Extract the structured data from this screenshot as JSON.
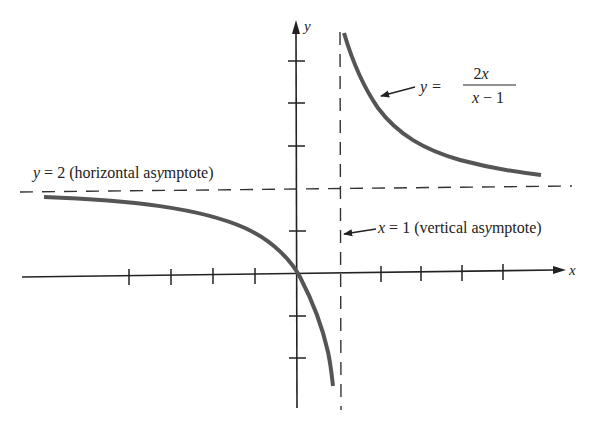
{
  "chart_data": {
    "type": "line",
    "title": "",
    "function_label": {
      "lhs": "y =",
      "numerator": "2x",
      "denominator": "x − 1"
    },
    "xlabel": "x",
    "ylabel": "y",
    "x_ticks": [
      -4,
      -3,
      -2,
      -1,
      1,
      2,
      3,
      4,
      5
    ],
    "y_ticks": [
      -2,
      -1,
      1,
      2,
      3,
      4,
      5
    ],
    "xlim": [
      -6.6,
      6.6
    ],
    "ylim": [
      -3.2,
      6.4
    ],
    "grid": false,
    "asymptotes": [
      {
        "type": "horizontal",
        "value": 2,
        "label": "y = 2 (horizontal asymptote)"
      },
      {
        "type": "vertical",
        "value": 1,
        "label": "x = 1 (vertical asymptote)"
      }
    ],
    "series": [
      {
        "name": "y = 2x/(x − 1), left branch",
        "x": [
          -6.0,
          -5.0,
          -4.0,
          -3.0,
          -2.0,
          -1.0,
          -0.5,
          0.0,
          0.3,
          0.5,
          0.7,
          0.8
        ],
        "y": [
          1.71,
          1.67,
          1.6,
          1.5,
          1.33,
          1.0,
          0.67,
          0.0,
          -0.86,
          -2.0,
          -4.67,
          -8.0
        ]
      },
      {
        "name": "y = 2x/(x − 1), right branch",
        "x": [
          1.1,
          1.2,
          1.5,
          2.0,
          3.0,
          4.0,
          5.0,
          6.0
        ],
        "y": [
          22.0,
          12.0,
          6.0,
          4.0,
          3.0,
          2.67,
          2.5,
          2.4
        ]
      }
    ],
    "color": "#555555"
  },
  "labels": {
    "y_axis": "y",
    "x_axis": "x",
    "fn_lhs": "y =",
    "fn_num": "2x",
    "fn_den": "x − 1",
    "h_asym": "y = 2 (horizontal asymptote)",
    "v_asym": "x = 1 (vertical asymptote)"
  }
}
